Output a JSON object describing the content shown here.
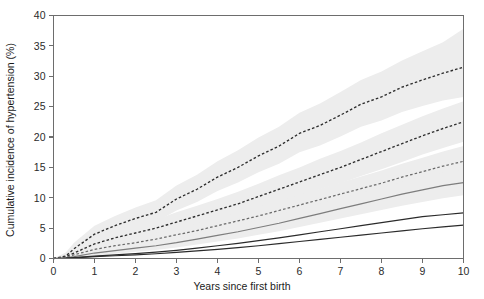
{
  "chart_data": {
    "type": "line",
    "title": "",
    "xlabel": "Years since first birth",
    "ylabel": "Cumulative incidence of hypertension (%)",
    "xlim": [
      0,
      10
    ],
    "ylim": [
      0,
      40
    ],
    "xticks": [
      0,
      1,
      2,
      3,
      4,
      5,
      6,
      7,
      8,
      9,
      10
    ],
    "xtick_labels": [
      "0",
      "1",
      "2",
      "3",
      "4",
      "5",
      "6",
      "7",
      "8",
      "9",
      "10"
    ],
    "yticks": [
      0,
      5,
      10,
      15,
      20,
      25,
      30,
      35,
      40
    ],
    "ytick_labels": [
      "0",
      "5",
      "10",
      "15",
      "20",
      "25",
      "30",
      "35",
      "40"
    ],
    "grid": false,
    "legend": "none",
    "x": [
      0,
      0.3,
      0.5,
      1,
      1.5,
      2,
      2.5,
      3,
      3.5,
      4,
      4.5,
      5,
      5.5,
      6,
      6.5,
      7,
      7.5,
      8,
      8.5,
      9,
      9.5,
      10
    ],
    "series": [
      {
        "name": "curve-1-dashed-upper",
        "style": "dashed",
        "color": "#2e2e2e",
        "values": [
          0,
          0.4,
          1.6,
          4.0,
          5.4,
          6.6,
          7.6,
          9.8,
          11.4,
          13.4,
          15.0,
          16.9,
          18.5,
          20.6,
          21.9,
          23.6,
          25.4,
          26.6,
          28.2,
          29.4,
          30.5,
          31.5
        ],
        "ci_upper": [
          0,
          1.0,
          2.6,
          5.4,
          7.0,
          8.4,
          9.6,
          12.0,
          13.8,
          16.0,
          17.8,
          19.9,
          21.7,
          24.0,
          25.5,
          27.4,
          29.4,
          30.8,
          32.6,
          34.1,
          35.6,
          37.8
        ],
        "ci_lower": [
          0,
          0.1,
          0.9,
          2.9,
          4.1,
          5.1,
          6.0,
          7.9,
          9.3,
          11.1,
          12.5,
          14.2,
          15.6,
          17.5,
          18.6,
          20.1,
          21.7,
          22.7,
          24.1,
          25.1,
          26.0,
          26.6
        ]
      },
      {
        "name": "curve-2-dashed-middle",
        "style": "dashed",
        "color": "#2e2e2e",
        "values": [
          0,
          0.3,
          0.9,
          2.4,
          3.4,
          4.2,
          5.0,
          6.0,
          7.0,
          8.0,
          9.0,
          10.2,
          11.4,
          12.6,
          13.8,
          15.0,
          16.3,
          17.6,
          18.9,
          20.2,
          21.4,
          22.5
        ],
        "ci_upper": [
          0,
          0.7,
          1.6,
          3.4,
          4.6,
          5.5,
          6.4,
          7.6,
          8.7,
          9.8,
          11.0,
          12.3,
          13.7,
          15.0,
          16.4,
          17.7,
          19.1,
          20.6,
          22.0,
          23.4,
          24.7,
          25.9
        ],
        "ci_lower": [
          0,
          0.1,
          0.5,
          1.7,
          2.5,
          3.1,
          3.8,
          4.6,
          5.5,
          6.3,
          7.2,
          8.2,
          9.2,
          10.3,
          11.4,
          12.4,
          13.6,
          14.7,
          15.9,
          17.1,
          18.2,
          19.2
        ]
      },
      {
        "name": "curve-3-dashed-lower",
        "style": "dashed-light",
        "color": "#6a6a6a",
        "values": [
          0,
          0.2,
          0.6,
          1.5,
          2.1,
          2.6,
          3.2,
          3.9,
          4.6,
          5.4,
          6.2,
          7.0,
          7.9,
          8.8,
          9.7,
          10.6,
          11.5,
          12.4,
          13.4,
          14.3,
          15.2,
          16.0
        ],
        "ci_upper": [
          0,
          0.5,
          1.1,
          2.2,
          2.9,
          3.5,
          4.2,
          5.0,
          5.8,
          6.7,
          7.6,
          8.5,
          9.5,
          10.5,
          11.5,
          12.5,
          13.5,
          14.5,
          15.6,
          16.6,
          17.6,
          18.5
        ],
        "ci_lower": [
          0,
          0.1,
          0.3,
          1.0,
          1.4,
          1.8,
          2.3,
          2.9,
          3.5,
          4.1,
          4.8,
          5.5,
          6.2,
          7.0,
          7.8,
          8.6,
          9.4,
          10.2,
          11.1,
          11.9,
          12.7,
          13.4
        ]
      },
      {
        "name": "curve-4-solid-gray",
        "style": "solid-gray",
        "color": "#7d7d7d",
        "values": [
          0,
          0.1,
          0.3,
          0.9,
          1.3,
          1.7,
          2.1,
          2.6,
          3.2,
          3.8,
          4.4,
          5.1,
          5.8,
          6.6,
          7.4,
          8.2,
          9.0,
          9.8,
          10.6,
          11.3,
          12.0,
          12.5
        ],
        "ci_upper": [
          0,
          0.3,
          0.6,
          1.4,
          1.9,
          2.4,
          2.9,
          3.5,
          4.2,
          4.9,
          5.6,
          6.4,
          7.2,
          8.1,
          9.0,
          9.9,
          10.8,
          11.7,
          12.6,
          13.4,
          14.1,
          14.7
        ],
        "ci_lower": [
          0,
          0.0,
          0.1,
          0.5,
          0.8,
          1.1,
          1.4,
          1.8,
          2.3,
          2.8,
          3.3,
          3.9,
          4.5,
          5.2,
          5.9,
          6.6,
          7.3,
          8.0,
          8.7,
          9.3,
          9.9,
          10.4
        ]
      },
      {
        "name": "curve-5-solid-dark-upper",
        "style": "solid-dark",
        "color": "#2b2b2b",
        "values": [
          0,
          0.05,
          0.15,
          0.4,
          0.6,
          0.8,
          1.05,
          1.35,
          1.7,
          2.1,
          2.5,
          2.95,
          3.4,
          3.9,
          4.4,
          4.9,
          5.4,
          5.9,
          6.4,
          6.9,
          7.2,
          7.5
        ],
        "ci_upper": null,
        "ci_lower": null
      },
      {
        "name": "curve-6-solid-dark-lower",
        "style": "solid-dark",
        "color": "#2b2b2b",
        "values": [
          0,
          0.03,
          0.1,
          0.3,
          0.45,
          0.6,
          0.78,
          1.0,
          1.25,
          1.5,
          1.8,
          2.1,
          2.45,
          2.8,
          3.15,
          3.5,
          3.85,
          4.2,
          4.55,
          4.9,
          5.2,
          5.5
        ],
        "ci_upper": null,
        "ci_lower": null
      }
    ],
    "band_color": "#ededed"
  },
  "axes": {
    "x_title": "Years since first birth",
    "y_title": "Cumulative incidence of hypertension (%)"
  }
}
